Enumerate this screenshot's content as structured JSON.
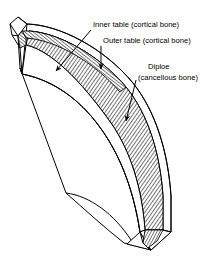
{
  "figure": {
    "type": "anatomical-line-drawing",
    "background_color": "#ffffff",
    "line_color": "#000000",
    "hatch_color": "#000000"
  },
  "annotations": {
    "inner_table": {
      "label": "Inner table (cortical bone)",
      "text_x": 93,
      "text_y": 27
    },
    "outer_table": {
      "label": "Outer table (cortical bone)",
      "text_x": 103,
      "text_y": 43
    },
    "diploe": {
      "label_line1": "Diploe",
      "label_line2": "(cancellous bone)",
      "line1_x": 148,
      "line1_y": 69,
      "line2_x": 138,
      "line2_y": 80
    }
  },
  "layers": [
    {
      "name": "outer-table",
      "description": "outer cortical bone plate",
      "fill": "#ffffff"
    },
    {
      "name": "diploe",
      "description": "cancellous bone, cross-hatched",
      "fill": "hatch"
    },
    {
      "name": "inner-table",
      "description": "inner cortical bone plate",
      "fill": "#ffffff"
    }
  ]
}
